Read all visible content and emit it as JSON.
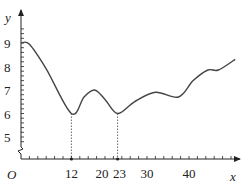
{
  "chart_data": {
    "type": "line",
    "title": "",
    "xlabel": "x",
    "ylabel": "y",
    "origin_label": "O",
    "x_ticks_labeled": [
      12,
      20,
      23,
      30,
      40
    ],
    "y_ticks_labeled": [
      5,
      6,
      7,
      8,
      9
    ],
    "x_range": [
      0,
      51
    ],
    "y_range": [
      4.6,
      9.6
    ],
    "y_axis_break": true,
    "grid": false,
    "legend": null,
    "series": [
      {
        "name": "y",
        "x": [
          0,
          2,
          6,
          12,
          15,
          17.5,
          20,
          23,
          27,
          32,
          37.5,
          41,
          44.5,
          47,
          51
        ],
        "y": [
          9.0,
          8.95,
          7.9,
          6.0,
          6.7,
          7.0,
          6.6,
          6.0,
          6.5,
          6.9,
          6.7,
          7.4,
          7.85,
          7.85,
          8.3
        ]
      }
    ],
    "annotations": [
      {
        "type": "dashed-drop-line",
        "x": 12,
        "y": 6
      },
      {
        "type": "dashed-drop-line",
        "x": 23,
        "y": 6
      }
    ]
  }
}
